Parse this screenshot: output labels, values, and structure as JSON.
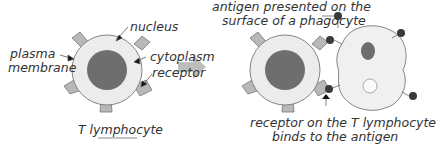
{
  "labels": {
    "nucleus": "nucleus",
    "plasma_membrane_1": "plasma",
    "plasma_membrane_2": "membrane",
    "cytoplasm": "cytoplasm",
    "receptor": "receptor",
    "t_lymphocyte": "T lymphocyte",
    "antigen_1": "antigen presented on the",
    "antigen_2": "surface of a phagocyte",
    "binds_1": "receptor on the T lymphocyte",
    "binds_2": "binds to the antigen"
  },
  "colors": {
    "cytoplasm": "#ececec",
    "nucleus": "#6e6e6e",
    "receptor": "#b5b5b5",
    "antigen": "#3a3a3a",
    "arrow": "#bdbdbd"
  }
}
